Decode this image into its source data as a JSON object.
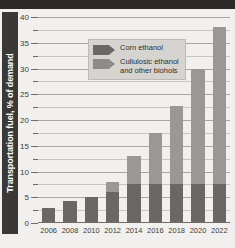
{
  "chart_data": {
    "type": "bar",
    "stacked": true,
    "title": "",
    "subtitle": "",
    "xlabel": "",
    "ylabel": "Transportation fuel, % of demand",
    "categories": [
      "2006",
      "2008",
      "2010",
      "2012",
      "2014",
      "2016",
      "2018",
      "2020",
      "2022"
    ],
    "series": [
      {
        "name": "Corn ethanol",
        "color": "#6a6865",
        "values": [
          3.0,
          4.2,
          5.1,
          6.0,
          7.5,
          7.5,
          7.5,
          7.5,
          7.5
        ]
      },
      {
        "name": "Cullulosic ethanol\nand other biohols",
        "color": "#9a9894",
        "values": [
          0,
          0,
          0,
          2.0,
          5.5,
          10.0,
          15.3,
          22.5,
          30.5
        ]
      }
    ],
    "totals": [
      3.0,
      4.2,
      5.1,
      8.0,
      13.0,
      17.5,
      22.8,
      30.0,
      38.0
    ],
    "ylim": [
      0,
      40
    ],
    "ytick_major": [
      "0",
      "5",
      "10",
      "15",
      "20",
      "25",
      "30",
      "35",
      "40"
    ],
    "ytick_major_values": [
      0,
      5,
      10,
      15,
      20,
      25,
      30,
      35,
      40
    ],
    "ytick_minor_values": [
      2.5,
      7.5,
      12.5,
      17.5,
      22.5,
      27.5,
      32.5,
      37.5
    ],
    "grid": true,
    "legend_position": "top-left",
    "legend": [
      {
        "label": "Corn ethanol",
        "color": "#6a6865"
      },
      {
        "label": "Cullulosic ethanol\nand other biohols",
        "color": "#8d8b87"
      }
    ]
  }
}
